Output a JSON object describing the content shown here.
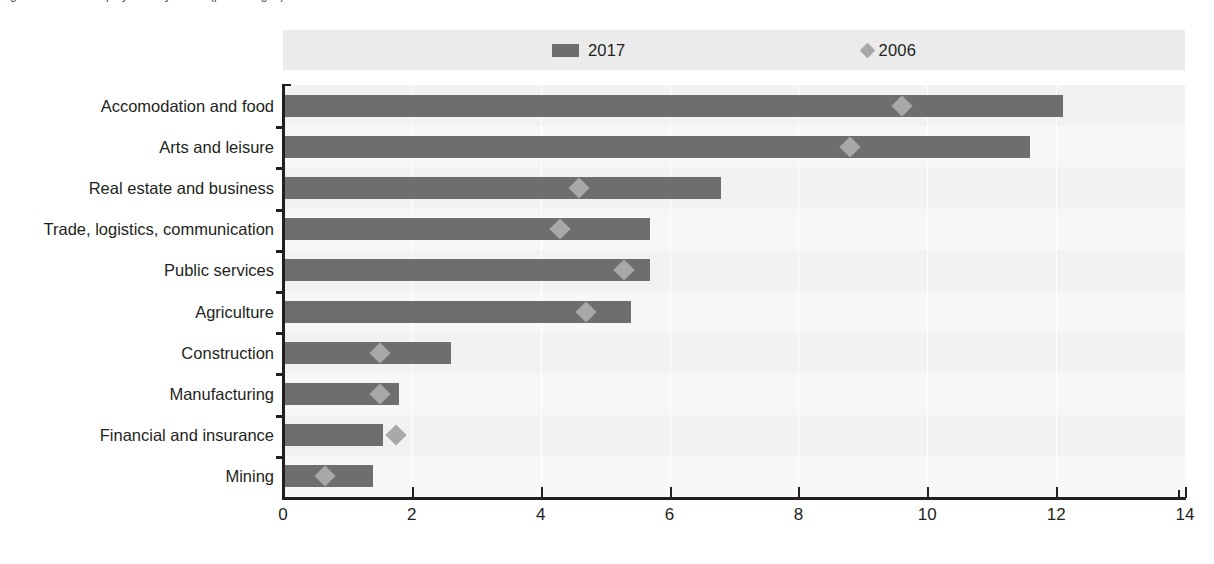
{
  "title_remnant": "Figure: Share of employment by sector (percentages)",
  "legend": {
    "position": "top-center",
    "entries": [
      {
        "label": "2017",
        "marker": "bar-swatch",
        "color": "#6e6e6e"
      },
      {
        "label": "2006",
        "marker": "diamond-swatch",
        "color": "#a8a8a8"
      }
    ]
  },
  "colors": {
    "bar_2017": "#6e6e6e",
    "marker_2006": "#a8a8a8",
    "plot_background": "#f2f2f2",
    "legend_background": "#ebebeb",
    "axis": "#231f20",
    "gridline": "#ffffff"
  },
  "chart_data": {
    "type": "bar",
    "orientation": "horizontal",
    "title": "",
    "xlabel": "",
    "ylabel": "",
    "xlim": [
      0,
      14
    ],
    "xticks": [
      0,
      2,
      4,
      6,
      8,
      10,
      12,
      14
    ],
    "grid": true,
    "legend_position": "top-center",
    "categories": [
      "Accomodation and food",
      "Arts and leisure",
      "Real estate and business",
      "Trade, logistics, communication",
      "Public services",
      "Agriculture",
      "Construction",
      "Manufacturing",
      "Financial and insurance",
      "Mining"
    ],
    "series": [
      {
        "name": "2017",
        "type": "bar",
        "values": [
          12.1,
          11.6,
          6.8,
          5.7,
          5.7,
          5.4,
          2.6,
          1.8,
          1.55,
          1.4
        ]
      },
      {
        "name": "2006",
        "type": "scatter",
        "values": [
          9.6,
          8.8,
          4.6,
          4.3,
          5.3,
          4.7,
          1.5,
          1.5,
          1.75,
          0.65
        ]
      }
    ]
  }
}
